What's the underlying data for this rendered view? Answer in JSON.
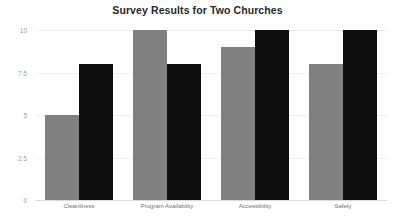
{
  "chart_data": {
    "type": "bar",
    "title": "Survey Results for Two Churches",
    "xlabel": "",
    "ylabel": "",
    "categories": [
      "Cleanliness",
      "Program Availability",
      "Accessibility",
      "Safety"
    ],
    "series": [
      {
        "name": "Church 1",
        "color": "#808080",
        "values": [
          5,
          10,
          9,
          8
        ]
      },
      {
        "name": "Church 2",
        "color": "#0d0d0d",
        "values": [
          8,
          8,
          10,
          10
        ]
      }
    ],
    "ylim": [
      0,
      10
    ],
    "ytick_labels": [
      "0",
      "2.5",
      "5",
      "7.5",
      "10"
    ],
    "ytick_values": [
      0,
      2.5,
      5,
      7.5,
      10
    ],
    "grid": true,
    "grid_axis": "y",
    "legend": "none",
    "legend_position": "none",
    "background_color": "#ffffff",
    "title_color": "#27282b",
    "tick_label_color": "#9a9da1",
    "category_label_color": "#6f7276",
    "gridline_color": "#eceff1",
    "baseline_color": "#d8dbdd"
  }
}
